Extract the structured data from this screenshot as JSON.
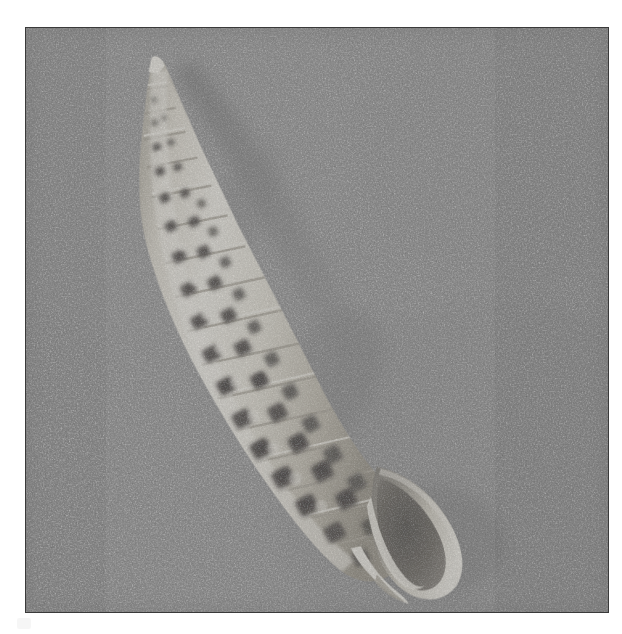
{
  "image": {
    "domain": "natural-image",
    "subject": "seashell",
    "common_name": "Spotted auger / turret shell",
    "description": "Monochrome photograph of a long slender spire-shaped spotted seashell lying diagonally on a coarse grainy gray surface",
    "orientation": "apex upper-left, aperture lower-right",
    "capture_style": "black-and-white film photograph, heavy grain, white paper border",
    "plate": {
      "left": 25,
      "top": 27,
      "width": 584,
      "height": 586,
      "border_color": "#3a3a3a",
      "background_color": "#828282",
      "paper_color": "#ffffff"
    },
    "palette": {
      "paper_white": "#ffffff",
      "plate_border": "#3a3a3a",
      "background_gray": "#828282",
      "background_grain_light": "#b4b4b4",
      "background_grain_dark": "#4e4e4e",
      "cast_shadow": "#5c5c5c",
      "shell_highlight": "#f2efe6",
      "shell_body": "#ddd8cb",
      "shell_midtone": "#b9b3a4",
      "shell_shade": "#8d8778",
      "spot_dark": "#3b3731",
      "spot_darker": "#262320",
      "aperture_shadow": "#4a4640"
    },
    "shell": {
      "apex": {
        "x": 152,
        "y": 58
      },
      "aperture_tip": {
        "x": 412,
        "y": 572
      },
      "axis_angle_deg": 61,
      "length_px": 520,
      "max_width_px": 108,
      "whorl_count": 17,
      "pattern": "two to three rows of dark rectangular spots per whorl, increasing in size toward the aperture",
      "features": [
        "needle-sharp apex",
        "beaded suture ridges between whorls",
        "checkered dark brown spot bands",
        "flared outer lip at aperture",
        "shadowed aperture interior",
        "short pointed siphonal canal"
      ]
    },
    "lighting": {
      "key_direction": "upper-left",
      "shadow_direction": "lower-right",
      "shadow_offset_px": 14
    }
  }
}
